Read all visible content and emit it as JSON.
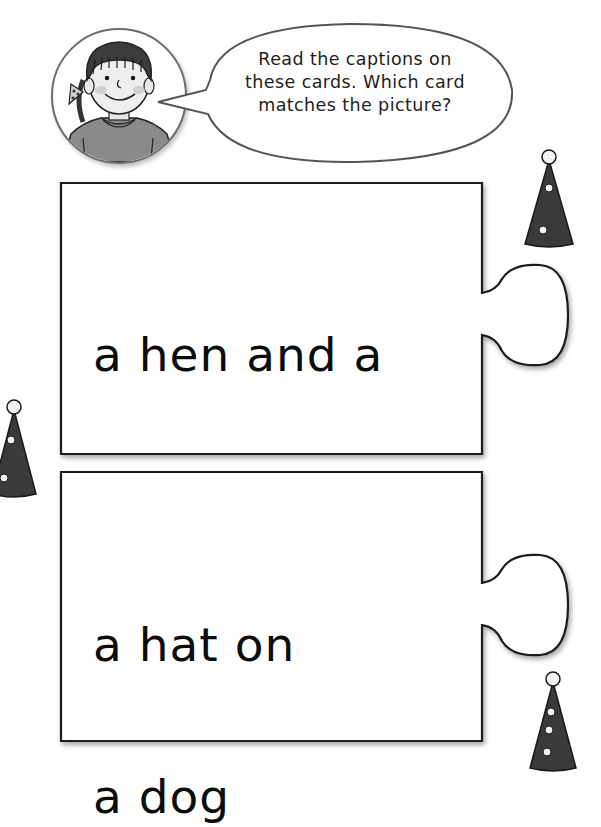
{
  "speech_bubble": {
    "lines": [
      "Read the captions on",
      "these cards. Which card",
      "matches the picture?"
    ]
  },
  "avatar": {
    "icon": "girl-portrait-icon",
    "description": "smiling girl with dark fringe hair and polka-dot hair bow"
  },
  "cards": [
    {
      "id": "card-1",
      "caption_line_1": "a hen and a",
      "caption_line_2": "bug"
    },
    {
      "id": "card-2",
      "caption_line_1": "a hat on",
      "caption_line_2": "a dog"
    }
  ],
  "decorations": {
    "party_hats": [
      {
        "icon": "party-hat-icon",
        "position": "top-right",
        "dots": 2
      },
      {
        "icon": "party-hat-icon",
        "position": "middle-left",
        "dots": 2
      },
      {
        "icon": "party-hat-icon",
        "position": "bottom-right",
        "dots": 3
      }
    ]
  },
  "colors": {
    "card_border": "#1a1a1a",
    "hat_fill": "#3a3a3a",
    "hat_dot": "#f2f2f2",
    "bubble_border": "#555555",
    "text": "#0c0c0c"
  }
}
